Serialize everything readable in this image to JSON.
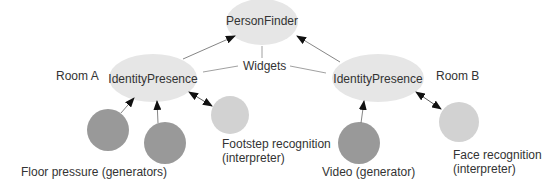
{
  "diagram": {
    "nodes": {
      "person_finder": "PersonFinder",
      "identity_presence_a": "IdentityPresence",
      "identity_presence_b": "IdentityPresence"
    },
    "labels": {
      "room_a": "Room A",
      "room_b": "Room B",
      "widgets": "Widgets",
      "floor_pressure": "Floor pressure (generators)",
      "footstep_line1": "Footstep recognition",
      "footstep_line2": "(interpreter)",
      "video": "Video (generator)",
      "face_line1": "Face recognition",
      "face_line2": "(interpreter)"
    },
    "colors": {
      "widget_node": "#e6e6e6",
      "generator": "#999999",
      "interpreter": "#d2d2d2",
      "edge": "#555555",
      "text": "#333333"
    }
  }
}
